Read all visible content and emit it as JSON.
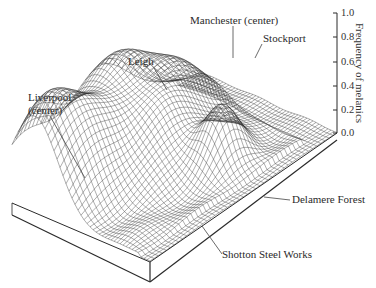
{
  "chart_data": {
    "type": "surface3d",
    "title": "",
    "zlabel": "Frequency of melanics",
    "zlim": [
      0.0,
      1.0
    ],
    "z_ticks": [
      "1.0",
      "0.8",
      "0.6",
      "0.4",
      "0.2",
      "0.0"
    ],
    "grid": false,
    "annotations": [
      {
        "label": "Manchester (center)",
        "approx_frequency": 0.9
      },
      {
        "label": "Stockport",
        "approx_frequency": 0.85
      },
      {
        "label": "Leigh",
        "approx_frequency": 0.75
      },
      {
        "label": "Liverpool (center)",
        "approx_frequency": 0.6
      },
      {
        "label": "Delamere Forest",
        "approx_frequency": 0.1
      },
      {
        "label": "Shotton Steel Works",
        "approx_frequency": 0.5
      }
    ]
  },
  "labels": {
    "manchester": "Manchester (center)",
    "stockport": "Stockport",
    "leigh": "Leigh",
    "liverpool_1": "Liverpool",
    "liverpool_2": "(center)",
    "delamere": "Delamere Forest",
    "shotton": "Shotton Steel Works"
  },
  "axis": {
    "ticks": [
      "1.0",
      "0.8",
      "0.6",
      "0.4",
      "0.2",
      "0.0"
    ],
    "title": "Frequency of melanics"
  },
  "colors": {
    "line": "#2a2a2a",
    "background": "#ffffff"
  }
}
